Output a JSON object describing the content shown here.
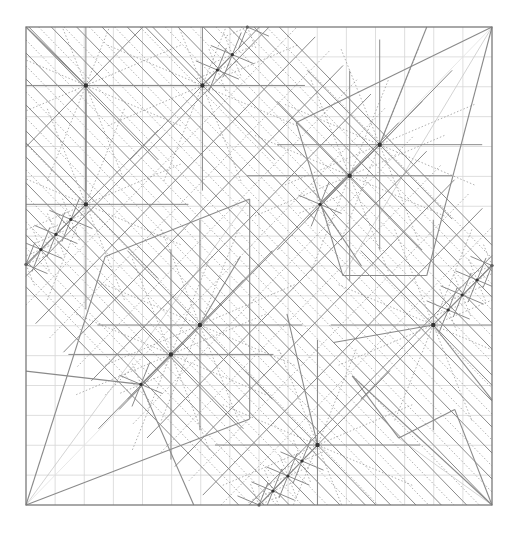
{
  "diagram": {
    "type": "origami-crease-pattern",
    "title": "",
    "grid_divisions": 16,
    "colors": {
      "paper": "#ffffff",
      "border": "#7a7a7a",
      "mountain": "#8a8a8a",
      "valley": "#9a9a9a",
      "grid": "#d6d6d6",
      "node": "#333333"
    },
    "line_styles": {
      "mountain": "solid",
      "valley": "dotted",
      "grid": "solid-light"
    },
    "star_nodes": [
      [
        0.1285,
        0.1223
      ],
      [
        0.3786,
        0.1223
      ],
      [
        0.4107,
        0.09
      ],
      [
        0.4428,
        0.0578
      ],
      [
        0.475,
        0.0
      ],
      [
        0.759,
        0.2462
      ],
      [
        0.6946,
        0.3111
      ],
      [
        0.631,
        0.371
      ],
      [
        0.1285,
        0.371
      ],
      [
        0.0963,
        0.4026
      ],
      [
        0.0642,
        0.434
      ],
      [
        0.032,
        0.4655
      ],
      [
        0.0,
        0.4968
      ],
      [
        0.3732,
        0.6234
      ],
      [
        0.311,
        0.685
      ],
      [
        0.2466,
        0.7477
      ],
      [
        0.874,
        0.6234
      ],
      [
        0.906,
        0.592
      ],
      [
        0.936,
        0.5607
      ],
      [
        0.968,
        0.5293
      ],
      [
        1.0,
        0.499
      ],
      [
        0.6256,
        0.8745
      ],
      [
        0.5923,
        0.908
      ],
      [
        0.562,
        0.9393
      ],
      [
        0.53,
        0.9707
      ],
      [
        0.5,
        1.0
      ]
    ],
    "small_star": [
      0.0644,
      0.03
    ],
    "pleat_bands": [
      {
        "from": [
          0.44,
          0.0
        ],
        "to": [
          1.0,
          0.56
        ],
        "count": 9
      },
      {
        "from": [
          0.0,
          0.44
        ],
        "to": [
          0.56,
          1.0
        ],
        "count": 9
      },
      {
        "from": [
          0.12,
          0.37
        ],
        "to": [
          0.63,
          0.87
        ],
        "count": 7
      }
    ]
  }
}
